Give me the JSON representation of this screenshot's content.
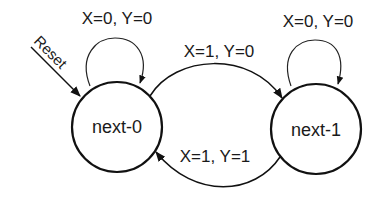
{
  "diagram": {
    "type": "finite-state-machine",
    "states": [
      {
        "id": "next-0",
        "label": "next-0",
        "initial": true
      },
      {
        "id": "next-1",
        "label": "next-1",
        "initial": false
      }
    ],
    "reset": {
      "label": "Reset",
      "target": "next-0"
    },
    "transitions": [
      {
        "from": "next-0",
        "to": "next-0",
        "label": "X=0, Y=0"
      },
      {
        "from": "next-1",
        "to": "next-1",
        "label": "X=0, Y=0"
      },
      {
        "from": "next-0",
        "to": "next-1",
        "label": "X=1, Y=0"
      },
      {
        "from": "next-1",
        "to": "next-0",
        "label": "X=1, Y=1"
      }
    ]
  }
}
